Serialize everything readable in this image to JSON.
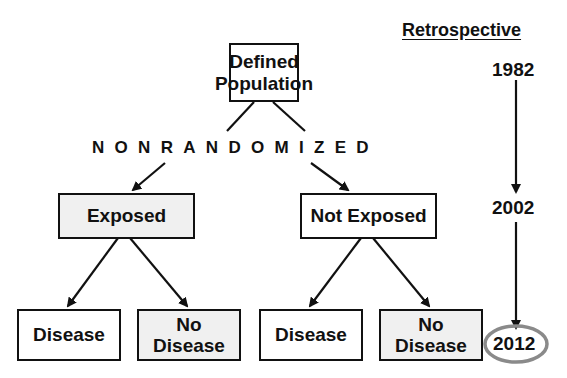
{
  "diagram": {
    "root": {
      "label": "Defined Population",
      "line1": "Defined",
      "line2": "Population"
    },
    "assignment_label": "NONRANDOMIZED",
    "groups": [
      {
        "label": "Exposed",
        "outcomes": [
          {
            "label": "Disease"
          },
          {
            "label": "No Disease",
            "line1": "No",
            "line2": "Disease"
          }
        ]
      },
      {
        "label": "Not Exposed",
        "outcomes": [
          {
            "label": "Disease"
          },
          {
            "label": "No Disease",
            "line1": "No",
            "line2": "Disease"
          }
        ]
      }
    ],
    "timeline": {
      "title": "Retrospective",
      "years": [
        "1982",
        "2002",
        "2012"
      ],
      "highlighted_year": "2012"
    }
  },
  "colors": {
    "line": "#111111",
    "shaded_fill": "#f0f0f0",
    "highlight_ring": "#8a8a8a"
  }
}
